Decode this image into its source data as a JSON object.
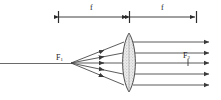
{
  "figure": {
    "type": "optics-ray-diagram",
    "colors": {
      "ray": "#555555",
      "outline": "#333333",
      "dimension": "#2b2b2b",
      "lens_fill": "#e9e9e9",
      "lens_stipple": "#9a9a9a",
      "background": "#ffffff",
      "label": "#1a1a1a"
    },
    "dimensions": [
      {
        "id": "left-focal-length",
        "label": "f",
        "label_x": 92,
        "label_y": 6,
        "x1": 58,
        "x2": 129,
        "y": 17
      },
      {
        "id": "right-focal-length",
        "label": "f",
        "label_x": 162,
        "label_y": 6,
        "x1": 129,
        "x2": 197,
        "y": 17
      }
    ],
    "points": [
      {
        "id": "front-focal-point",
        "label": "F",
        "sub": "1",
        "x": 56,
        "y": 56,
        "node_x": 71,
        "node_y": 63
      },
      {
        "id": "rear-focal-point",
        "label": "F",
        "sub": "2",
        "x": 184,
        "y": 54,
        "tick_x": 188,
        "tick_y": 63
      }
    ],
    "optical_axis": {
      "x1": 0,
      "x2": 72,
      "y": 63
    },
    "lens": {
      "id": "biconvex-lens",
      "shape": "biconvex",
      "center_x": 129,
      "top_y": 33,
      "bottom_y": 92,
      "half_width": 9,
      "fill": "#e9e9e9"
    },
    "incident_rays": {
      "count": 5,
      "origin_x": 71,
      "origin_y": 63,
      "arrow_t": 0.62,
      "lens_y": [
        42,
        53,
        63,
        74,
        85
      ]
    },
    "emergent_rays": {
      "count": 5,
      "start_x": 132,
      "end_x": 211,
      "y": [
        42,
        53,
        63,
        74,
        85
      ]
    }
  }
}
